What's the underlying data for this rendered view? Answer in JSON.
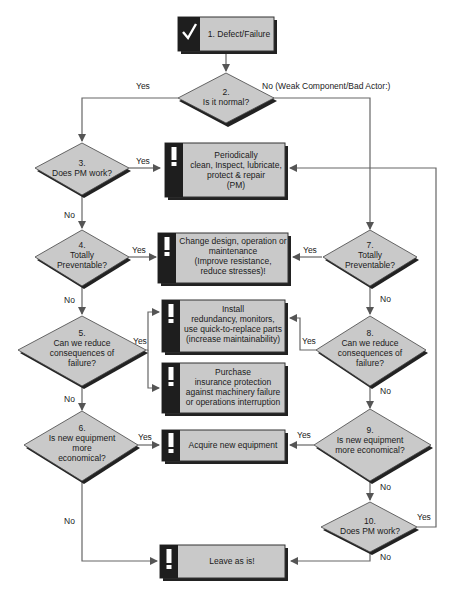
{
  "diagram": {
    "type": "flowchart",
    "colors": {
      "fill": "#c8c8c8",
      "shadow": "#222222",
      "stripe": "#1e1e1e",
      "line": "#555555"
    },
    "start": {
      "id": 1,
      "icon": "check-icon",
      "label": "1. Defect/Failure"
    },
    "decisions": [
      {
        "id": 2,
        "lines": [
          "2.",
          "Is it normal?"
        ]
      },
      {
        "id": 3,
        "lines": [
          "3.",
          "Does PM work?"
        ]
      },
      {
        "id": 4,
        "lines": [
          "4.",
          "Totally",
          "Preventable?"
        ]
      },
      {
        "id": 5,
        "lines": [
          "5.",
          "Can we reduce",
          "consequences of",
          "failure?"
        ]
      },
      {
        "id": 6,
        "lines": [
          "6.",
          "Is new equipment",
          "more",
          "economical?"
        ]
      },
      {
        "id": 7,
        "lines": [
          "7.",
          "Totally",
          "Preventable?"
        ]
      },
      {
        "id": 8,
        "lines": [
          "8.",
          "Can we reduce",
          "consequences of",
          "failure?"
        ]
      },
      {
        "id": 9,
        "lines": [
          "9.",
          "Is new equipment",
          "more economical?"
        ]
      },
      {
        "id": 10,
        "lines": [
          "10.",
          "Does PM work?"
        ]
      }
    ],
    "actions": [
      {
        "key": "pm",
        "icon": "exclamation-icon",
        "lines": [
          "Periodically",
          "clean, Inspect, lubricate,",
          "protect & repair",
          "(PM)"
        ]
      },
      {
        "key": "change",
        "icon": "exclamation-icon",
        "lines": [
          "Change design, operation or",
          "maintenance",
          "(Improve resistance,",
          "reduce stresses)!"
        ]
      },
      {
        "key": "install",
        "icon": "exclamation-icon",
        "lines": [
          "Install",
          "redundancy, monitors,",
          "use quick-to-replace parts",
          "(increase maintainability)"
        ]
      },
      {
        "key": "purchase",
        "icon": "exclamation-icon",
        "lines": [
          "Purchase",
          "insurance protection",
          "against machinery failure",
          "or operations interruption"
        ]
      },
      {
        "key": "acquire",
        "icon": "exclamation-icon",
        "lines": [
          "Acquire new equipment"
        ]
      },
      {
        "key": "leave",
        "icon": "exclamation-icon",
        "lines": [
          "Leave as is!"
        ]
      }
    ],
    "edge_labels": {
      "d2_yes": "Yes",
      "d2_no": "No (Weak Component/Bad Actor:)",
      "d3_yes": "Yes",
      "d3_no": "No",
      "d4_yes": "Yes",
      "d4_no": "No",
      "d5_yes": "Yes",
      "d5_no": "No",
      "d6_yes": "Yes",
      "d6_no": "No",
      "d7_yes": "Yes",
      "d7_no": "No",
      "d8_yes": "Yes",
      "d8_no": "No",
      "d9_yes": "Yes",
      "d9_no": "No",
      "d10_yes": "Yes",
      "d10_no": "No"
    }
  }
}
